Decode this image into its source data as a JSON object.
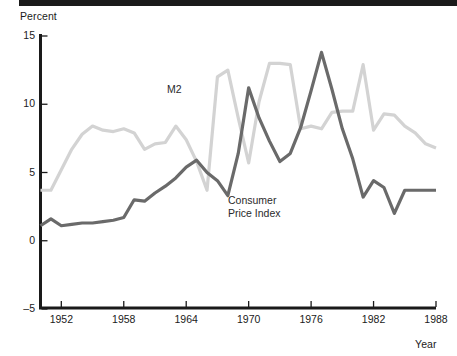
{
  "figure": {
    "top_rule_color": "#1a1a1a",
    "background": "#ffffff"
  },
  "labels": {
    "y_axis_title": "Percent",
    "x_axis_title": "Year",
    "m2_series_label": "M2",
    "cpi_series_label_line1": "Consumer",
    "cpi_series_label_line2": "Price Index"
  },
  "chart_data": {
    "type": "line",
    "title": "",
    "subtitle": "",
    "xlabel": "Year",
    "ylabel": "Percent",
    "xlim": [
      1950,
      1988
    ],
    "ylim": [
      -5,
      15
    ],
    "yticks": [
      -5,
      0,
      5,
      10,
      15
    ],
    "ytick_labels": [
      "-5",
      "0",
      "5",
      "10",
      "15"
    ],
    "xticks": [
      1952,
      1958,
      1964,
      1970,
      1976,
      1982,
      1988
    ],
    "xtick_labels": [
      "1952",
      "1958",
      "1964",
      "1970",
      "1976",
      "1982",
      "1988"
    ],
    "grid": false,
    "legend_position": "inline-annotations",
    "x": [
      1950,
      1951,
      1952,
      1953,
      1954,
      1955,
      1956,
      1957,
      1958,
      1959,
      1960,
      1961,
      1962,
      1963,
      1964,
      1965,
      1966,
      1967,
      1968,
      1969,
      1970,
      1971,
      1972,
      1973,
      1974,
      1975,
      1976,
      1977,
      1978,
      1979,
      1980,
      1981,
      1982,
      1983,
      1984,
      1985,
      1986,
      1987,
      1988
    ],
    "series": [
      {
        "name": "M2",
        "color": "#d3d3d3",
        "values": [
          3.7,
          3.7,
          5.2,
          6.7,
          7.8,
          8.4,
          8.1,
          8.0,
          8.2,
          7.9,
          6.7,
          7.1,
          7.2,
          8.4,
          7.4,
          5.8,
          3.7,
          12.0,
          12.5,
          9.0,
          5.7,
          10.2,
          13.0,
          13.0,
          12.9,
          8.2,
          8.4,
          8.2,
          9.4,
          9.5,
          9.5,
          12.9,
          8.1,
          9.3,
          9.2,
          8.4,
          7.9,
          7.1,
          6.8
        ],
        "ylim": [
          -5,
          15
        ]
      },
      {
        "name": "Consumer Price Index",
        "color": "#6a6a6a",
        "values": [
          1.1,
          1.6,
          1.1,
          1.2,
          1.3,
          1.3,
          1.4,
          1.5,
          1.7,
          3.0,
          2.9,
          3.5,
          4.0,
          4.6,
          5.4,
          5.9,
          5.0,
          4.4,
          3.3,
          6.4,
          11.2,
          9.0,
          7.3,
          5.8,
          6.4,
          8.3,
          11.0,
          13.8,
          11.1,
          8.2,
          6.0,
          3.2,
          4.4,
          3.9,
          2.0,
          3.7,
          3.7,
          3.7,
          3.7
        ],
        "ylim": [
          -5,
          15
        ]
      }
    ]
  }
}
